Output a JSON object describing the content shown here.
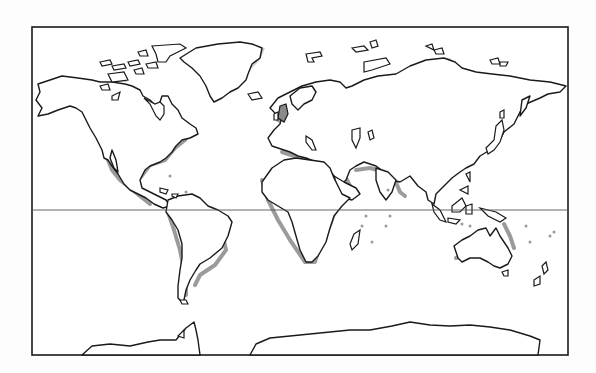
{
  "map": {
    "type": "world-outline-map",
    "projection": "mercator-like",
    "frame": {
      "x": 32,
      "y": 27,
      "width": 536,
      "height": 328,
      "stroke": "#1a1a1a"
    },
    "equator": {
      "y": 210,
      "color": "#555555"
    },
    "colors": {
      "land": "#ffffff",
      "coastline": "#1a1a1a",
      "continental_shelf": "#8a8a8a",
      "arctic_shelf": "#cfcfcf",
      "ocean": "#ffffff"
    },
    "landmasses": [
      {
        "name": "north-america"
      },
      {
        "name": "greenland"
      },
      {
        "name": "south-america"
      },
      {
        "name": "europe-asia"
      },
      {
        "name": "africa"
      },
      {
        "name": "australia"
      },
      {
        "name": "antarctica"
      },
      {
        "name": "madagascar"
      },
      {
        "name": "japan"
      },
      {
        "name": "british-isles"
      },
      {
        "name": "indonesia"
      },
      {
        "name": "new-guinea"
      },
      {
        "name": "new-zealand"
      }
    ],
    "labels": []
  }
}
